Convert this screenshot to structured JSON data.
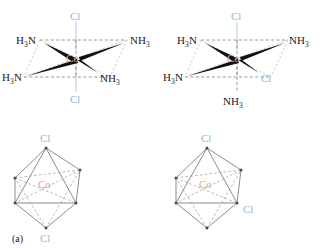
{
  "figure": {
    "background_color": "#ffffff",
    "colors": {
      "chlorine": "#8fb8d8",
      "cobalt": "#e4a183",
      "ligand_text": "#1a1a1a",
      "bond_solid": "#111111",
      "bond_dashed": "#8a8a8a",
      "octahedron_edge": "#6e6e6e"
    }
  },
  "panels": [
    {
      "id": "a",
      "caption": "(a)",
      "isomer": "trans",
      "structure": {
        "center_label": "Co",
        "ligands": [
          {
            "position": "top",
            "element": "Cl",
            "text": "Cl",
            "sub": "",
            "type": "chloride",
            "bond": "dashed-vertical"
          },
          {
            "position": "bottom",
            "element": "Cl",
            "text": "Cl",
            "sub": "",
            "type": "chloride",
            "bond": "dashed-vertical"
          },
          {
            "position": "upper-left",
            "element": "H3N",
            "text": "H",
            "sub": "3",
            "tail": "N",
            "type": "ammine",
            "bond": "solid-wedge"
          },
          {
            "position": "upper-right",
            "element": "NH3",
            "text": "NH",
            "sub": "3",
            "type": "ammine",
            "bond": "solid-wedge"
          },
          {
            "position": "lower-left",
            "element": "H3N",
            "text": "H",
            "sub": "3",
            "tail": "N",
            "type": "ammine",
            "bond": "solid-wedge"
          },
          {
            "position": "lower-right",
            "element": "NH3",
            "text": "NH",
            "sub": "3",
            "type": "ammine",
            "bond": "solid-wedge"
          }
        ]
      },
      "octahedron": {
        "center_label": "Co",
        "vertex_labels": [
          {
            "vertex": "top",
            "text": "Cl"
          },
          {
            "vertex": "bottom",
            "text": "Cl"
          }
        ]
      }
    },
    {
      "id": "b",
      "caption": "(b)",
      "isomer": "cis",
      "structure": {
        "center_label": "Co",
        "ligands": [
          {
            "position": "top",
            "element": "Cl",
            "text": "Cl",
            "sub": "",
            "type": "chloride",
            "bond": "dashed-vertical"
          },
          {
            "position": "bottom",
            "element": "NH3",
            "text": "NH",
            "sub": "3",
            "type": "ammine",
            "bond": "dashed-vertical"
          },
          {
            "position": "upper-left",
            "element": "H3N",
            "text": "H",
            "sub": "3",
            "tail": "N",
            "type": "ammine",
            "bond": "solid-wedge"
          },
          {
            "position": "upper-right",
            "element": "NH3",
            "text": "NH",
            "sub": "3",
            "type": "ammine",
            "bond": "solid-wedge"
          },
          {
            "position": "lower-left",
            "element": "H3N",
            "text": "H",
            "sub": "3",
            "tail": "N",
            "type": "ammine",
            "bond": "solid-wedge"
          },
          {
            "position": "lower-right",
            "element": "Cl",
            "text": "Cl",
            "sub": "",
            "type": "chloride",
            "bond": "solid-wedge"
          }
        ]
      },
      "octahedron": {
        "center_label": "Co",
        "vertex_labels": [
          {
            "vertex": "top",
            "text": "Cl"
          },
          {
            "vertex": "front-right",
            "text": "Cl"
          }
        ]
      }
    }
  ]
}
